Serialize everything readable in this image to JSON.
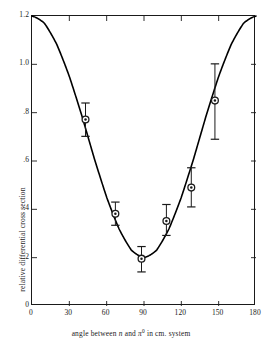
{
  "chart_data": {
    "type": "line",
    "title": "",
    "subtitle": "",
    "xlabel": "angle between n and π⁰ in cm. system",
    "ylabel": "relative differential cross section",
    "xlim": [
      0,
      180
    ],
    "ylim": [
      0,
      1.2
    ],
    "grid": false,
    "legend": "none",
    "xticks": [
      0,
      30,
      60,
      90,
      120,
      150,
      180
    ],
    "xtick_labels": [
      "0",
      "30",
      "60",
      "90",
      "120",
      "150",
      "180"
    ],
    "yticks": [
      0,
      0.2,
      0.4,
      0.6,
      0.8,
      1.0,
      1.2
    ],
    "ytick_labels": [
      "0",
      ".2",
      ".4",
      ".6",
      ".8",
      "1.0",
      "1.2"
    ],
    "series": [
      {
        "name": "fitted curve",
        "type": "line",
        "style": "solid",
        "color": "#000000",
        "note": "smooth curve of the form a + b cos^2(theta), minimum 0.20 at 90 degrees, 1.20 at 0 and 180 degrees",
        "x": [
          0,
          10,
          20,
          30,
          40,
          50,
          60,
          70,
          80,
          90,
          100,
          110,
          120,
          130,
          140,
          150,
          160,
          170,
          180
        ],
        "y": [
          1.2,
          1.17,
          1.08,
          0.95,
          0.79,
          0.61,
          0.45,
          0.32,
          0.23,
          0.2,
          0.23,
          0.32,
          0.45,
          0.61,
          0.79,
          0.95,
          1.08,
          1.17,
          1.2
        ]
      },
      {
        "name": "measured points",
        "type": "scatter",
        "marker": "circle-with-center-dot",
        "color": "#000000",
        "points": [
          {
            "x": 43,
            "y": 0.772,
            "yerr_low": 0.07,
            "yerr_high": 0.068,
            "label": "43°, 0.77"
          },
          {
            "x": 67,
            "y": 0.382,
            "yerr_low": 0.048,
            "yerr_high": 0.048,
            "label": "67°, 0.38"
          },
          {
            "x": 88,
            "y": 0.196,
            "yerr_low": 0.055,
            "yerr_high": 0.05,
            "label": "88°, 0.20"
          },
          {
            "x": 108,
            "y": 0.352,
            "yerr_low": 0.06,
            "yerr_high": 0.068,
            "label": "108°, 0.35"
          },
          {
            "x": 128,
            "y": 0.49,
            "yerr_low": 0.08,
            "yerr_high": 0.082,
            "label": "128°, 0.49"
          },
          {
            "x": 147,
            "y": 0.85,
            "yerr_low": 0.16,
            "yerr_high": 0.152,
            "label": "147°, 0.85"
          }
        ]
      }
    ],
    "axis_style": {
      "box": true,
      "ticks_on_all_sides": true,
      "tick_direction": "inward",
      "frame_color": "#1a1a1a"
    }
  }
}
